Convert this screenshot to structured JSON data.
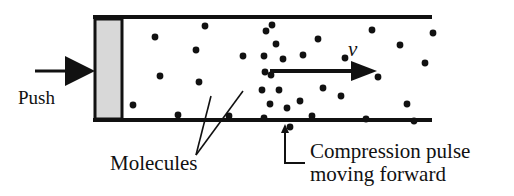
{
  "figure": {
    "width": 514,
    "height": 196,
    "background_color": "#ffffff",
    "ink_color": "#111111"
  },
  "labels": {
    "push": "Push",
    "velocity": "v",
    "molecules": "Molecules",
    "compression_line1": "Compression pulse",
    "compression_line2": "moving forward"
  },
  "tube": {
    "left": 93,
    "right": 432,
    "top_y": 17,
    "bottom_y": 120,
    "line_width": 4,
    "line_color": "#111111"
  },
  "piston": {
    "x": 95,
    "y": 19,
    "width": 27,
    "height": 100,
    "fill_color": "#d8d8d8",
    "stroke_color": "#111111",
    "stroke_width": 3
  },
  "push_arrow": {
    "tail_x": 35,
    "head_x": 95,
    "y": 71,
    "shaft_width": 3,
    "head_length": 30,
    "head_half_height": 15,
    "color": "#111111"
  },
  "velocity_arrow": {
    "tail_x": 270,
    "head_x": 377,
    "y": 71,
    "shaft_width": 4,
    "head_length": 26,
    "head_half_height": 10,
    "color": "#111111"
  },
  "molecules_leaders": [
    {
      "x1": 196,
      "y1": 155,
      "x2": 211,
      "y2": 96
    },
    {
      "x1": 196,
      "y1": 155,
      "x2": 243,
      "y2": 91
    }
  ],
  "compression_pointer": {
    "arrow_x": 285,
    "arrow_top_y": 124,
    "corner_y": 163,
    "horizontal_end_x": 305,
    "line_width": 2,
    "color": "#111111"
  },
  "molecules": {
    "radius": 3.4,
    "color": "#111111",
    "points": [
      [
        155,
        37
      ],
      [
        205,
        26
      ],
      [
        160,
        76
      ],
      [
        133,
        105
      ],
      [
        178,
        115
      ],
      [
        196,
        50
      ],
      [
        199,
        82
      ],
      [
        243,
        56
      ],
      [
        229,
        116
      ],
      [
        266,
        31
      ],
      [
        276,
        44
      ],
      [
        264,
        56
      ],
      [
        283,
        59
      ],
      [
        303,
        55
      ],
      [
        265,
        72
      ],
      [
        271,
        75
      ],
      [
        262,
        90
      ],
      [
        279,
        90
      ],
      [
        270,
        104
      ],
      [
        287,
        108
      ],
      [
        264,
        118
      ],
      [
        290,
        127
      ],
      [
        272,
        25
      ],
      [
        300,
        101
      ],
      [
        318,
        39
      ],
      [
        323,
        88
      ],
      [
        312,
        116
      ],
      [
        345,
        58
      ],
      [
        341,
        96
      ],
      [
        372,
        30
      ],
      [
        378,
        77
      ],
      [
        366,
        119
      ],
      [
        400,
        45
      ],
      [
        407,
        104
      ],
      [
        414,
        121
      ],
      [
        425,
        63
      ],
      [
        433,
        33
      ]
    ]
  }
}
